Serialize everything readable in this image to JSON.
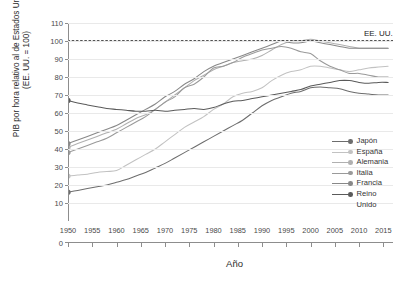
{
  "chart_data": {
    "type": "line",
    "title": "",
    "xlabel": "Año",
    "ylabel": "PIB por hora relativo al de Estados Unidos\n(EE. UU. = 100)",
    "xlim": [
      1950,
      2017
    ],
    "ylim": [
      0,
      110
    ],
    "ytick_values": [
      0,
      10,
      20,
      30,
      40,
      50,
      60,
      70,
      80,
      90,
      100,
      110
    ],
    "xtick_values": [
      1950,
      1955,
      1960,
      1965,
      1970,
      1975,
      1980,
      1985,
      1990,
      1995,
      2000,
      2005,
      2010,
      2015
    ],
    "grid": true,
    "legend_position": "right-inside",
    "annotations": [
      {
        "text": "EE. UU.",
        "x": 2011,
        "y": 103.5
      }
    ],
    "reference_line": {
      "label": "EE. UU.",
      "value": 100,
      "style": "dotted",
      "color": "#1a1a1a"
    },
    "series": [
      {
        "name": "Japón",
        "color": "#6d6d6d",
        "marker_start": true,
        "x": [
          1950,
          1952,
          1954,
          1956,
          1958,
          1960,
          1962,
          1964,
          1966,
          1968,
          1970,
          1972,
          1974,
          1976,
          1978,
          1980,
          1982,
          1984,
          1986,
          1988,
          1990,
          1992,
          1994,
          1996,
          1998,
          2000,
          2002,
          2004,
          2006,
          2008,
          2010,
          2012,
          2014,
          2016
        ],
        "values": [
          16,
          17,
          18,
          19,
          20,
          21.5,
          23,
          25,
          27,
          29.5,
          32,
          35,
          38,
          41,
          44,
          47,
          50,
          53,
          56,
          60,
          64,
          67,
          69,
          71,
          72,
          74,
          74.5,
          74,
          73.5,
          72,
          71,
          70.5,
          70,
          70
        ]
      },
      {
        "name": "España",
        "color": "#c2c2c2",
        "marker_start": true,
        "x": [
          1950,
          1952,
          1954,
          1956,
          1958,
          1960,
          1962,
          1964,
          1966,
          1968,
          1970,
          1972,
          1974,
          1976,
          1978,
          1980,
          1982,
          1984,
          1986,
          1988,
          1990,
          1992,
          1994,
          1996,
          1998,
          2000,
          2002,
          2004,
          2006,
          2008,
          2010,
          2012,
          2014,
          2016
        ],
        "values": [
          25,
          25.5,
          26,
          27,
          27.5,
          28,
          31,
          34,
          37,
          40,
          44,
          48,
          52,
          55,
          58,
          62,
          65,
          69,
          71,
          72,
          74,
          78,
          81,
          83,
          84,
          86,
          86,
          85,
          84,
          83,
          84,
          85,
          85.5,
          86
        ]
      },
      {
        "name": "Alemania",
        "color": "#b0b0b0",
        "marker_start": true,
        "x": [
          1950,
          1952,
          1954,
          1956,
          1958,
          1960,
          1962,
          1964,
          1966,
          1968,
          1970,
          1972,
          1974,
          1976,
          1978,
          1980,
          1982,
          1984,
          1986,
          1988,
          1990,
          1992,
          1994,
          1996,
          1998,
          2000,
          2002,
          2004,
          2006,
          2008,
          2010,
          2012,
          2014,
          2016
        ],
        "values": [
          41,
          43,
          45,
          47,
          49,
          51,
          54,
          57,
          59,
          62,
          66,
          70,
          74,
          78,
          81,
          84,
          86,
          88,
          89,
          90,
          92,
          95,
          98,
          100,
          100,
          101,
          100,
          99,
          98,
          97,
          96,
          96,
          96,
          96
        ]
      },
      {
        "name": "Italia",
        "color": "#9a9a9a",
        "marker_start": true,
        "x": [
          1950,
          1952,
          1954,
          1956,
          1958,
          1960,
          1962,
          1964,
          1966,
          1968,
          1970,
          1972,
          1974,
          1976,
          1978,
          1980,
          1982,
          1984,
          1986,
          1988,
          1990,
          1992,
          1994,
          1996,
          1998,
          2000,
          2002,
          2004,
          2006,
          2008,
          2010,
          2012,
          2014,
          2016
        ],
        "values": [
          38,
          40,
          42,
          44,
          46,
          49,
          52,
          55,
          58,
          62,
          66,
          69,
          74,
          76,
          80,
          85,
          86,
          88,
          91,
          93,
          95,
          96,
          97,
          96,
          94,
          93,
          89,
          86,
          84,
          82,
          82,
          81,
          80,
          80
        ]
      },
      {
        "name": "Francia",
        "color": "#888888",
        "marker_start": true,
        "x": [
          1950,
          1952,
          1954,
          1956,
          1958,
          1960,
          1962,
          1964,
          1966,
          1968,
          1970,
          1972,
          1974,
          1976,
          1978,
          1980,
          1982,
          1984,
          1986,
          1988,
          1990,
          1992,
          1994,
          1996,
          1998,
          2000,
          2002,
          2004,
          2006,
          2008,
          2010,
          2012,
          2014,
          2016
        ],
        "values": [
          43,
          45,
          47,
          49,
          51,
          53,
          56,
          59,
          62,
          65,
          69,
          72,
          76,
          79,
          83,
          86,
          88,
          90,
          92,
          94,
          96,
          98,
          100,
          99,
          99,
          100,
          99,
          98,
          97,
          96,
          96,
          96,
          96,
          96
        ]
      },
      {
        "name": "Reino Unido",
        "color": "#5a5a5a",
        "marker_start": true,
        "x": [
          1950,
          1952,
          1954,
          1956,
          1958,
          1960,
          1962,
          1964,
          1966,
          1968,
          1970,
          1972,
          1974,
          1976,
          1978,
          1980,
          1982,
          1984,
          1986,
          1988,
          1990,
          1992,
          1994,
          1996,
          1998,
          2000,
          2002,
          2004,
          2006,
          2008,
          2010,
          2012,
          2014,
          2016
        ],
        "values": [
          67,
          65.5,
          64.5,
          63.5,
          62.5,
          62,
          61.5,
          61,
          61,
          61.5,
          61,
          61.5,
          62,
          62.5,
          62,
          63,
          65,
          66.5,
          67,
          68,
          69,
          70,
          71,
          72,
          73,
          75,
          76,
          77,
          78,
          78,
          77,
          76.5,
          77,
          77
        ]
      }
    ]
  },
  "legend": {
    "items": [
      {
        "label": "Japón",
        "color": "#6d6d6d"
      },
      {
        "label": "España",
        "color": "#c2c2c2"
      },
      {
        "label": "Alemania",
        "color": "#b0b0b0"
      },
      {
        "label": "Italia",
        "color": "#9a9a9a"
      },
      {
        "label": "Francia",
        "color": "#888888"
      },
      {
        "label": "Reino\nUnido",
        "color": "#5a5a5a"
      }
    ]
  }
}
